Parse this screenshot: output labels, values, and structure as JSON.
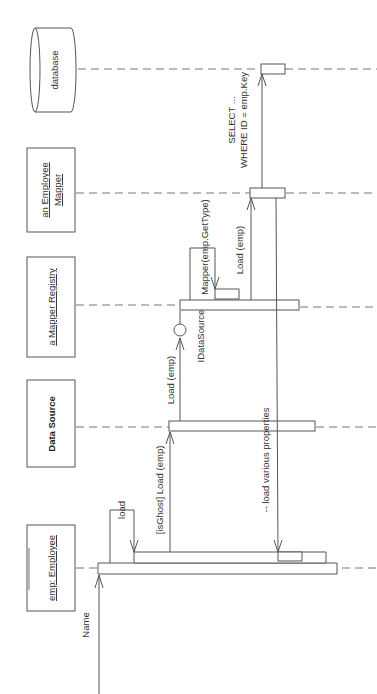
{
  "diagram": {
    "type": "UML sequence diagram",
    "orientation": "rotated 90° counter-clockwise",
    "participants": [
      {
        "id": "employee",
        "label": "emp: Employee",
        "underlined": true,
        "bold": false,
        "shape": "box"
      },
      {
        "id": "datasource",
        "label": "Data Source",
        "underlined": false,
        "bold": true,
        "shape": "box"
      },
      {
        "id": "registry",
        "label": "a Mapper Registry",
        "underlined": true,
        "bold": false,
        "shape": "box"
      },
      {
        "id": "mapper",
        "label_line1": "an Employee",
        "label_line2": "Mapper",
        "underlined": true,
        "bold": false,
        "shape": "box"
      },
      {
        "id": "database",
        "label": "database",
        "underlined": false,
        "bold": false,
        "shape": "cylinder"
      }
    ],
    "messages": [
      {
        "id": "name",
        "label": "Name",
        "from": "external",
        "to": "employee"
      },
      {
        "id": "load",
        "label": "load",
        "from": "employee",
        "to": "employee",
        "self": true
      },
      {
        "id": "isghost_load",
        "label": "[isGhost] Load (emp)",
        "from": "employee",
        "to": "datasource"
      },
      {
        "id": "load_emp_1",
        "label": "Load (emp)",
        "from": "datasource",
        "to": "registry"
      },
      {
        "id": "interface",
        "label": "IDataSource",
        "kind": "interface-lollipop"
      },
      {
        "id": "mapper_call",
        "label": "Mapper(emp.GetType)",
        "from": "registry",
        "to": "registry",
        "self": true
      },
      {
        "id": "load_emp_2",
        "label": "Load (emp)",
        "from": "registry",
        "to": "mapper"
      },
      {
        "id": "select",
        "label_line1": "SELECT ...",
        "label_line2": "WHERE ID = emp.Key",
        "from": "mapper",
        "to": "database"
      },
      {
        "id": "load_props",
        "label": "-- load various properties",
        "from": "mapper",
        "to": "employee"
      }
    ]
  }
}
